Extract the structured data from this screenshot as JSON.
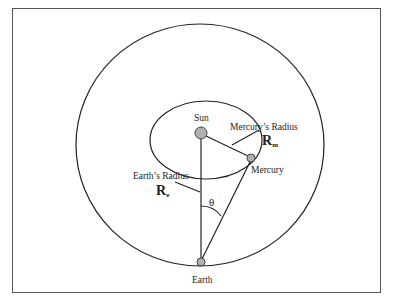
{
  "diagram": {
    "title": "",
    "labels": {
      "sun": "Sun",
      "mercury": "Mercury",
      "earth": "Earth",
      "mercury_radius": "Mercury’s Radius",
      "earth_radius": "Earth’s Radius",
      "rm_main": "R",
      "rm_sub": "m",
      "re_main": "R",
      "re_sub": "e",
      "angle": "θ"
    },
    "bodies": [
      {
        "name": "Sun",
        "cx": 201,
        "cy": 133,
        "r": 6
      },
      {
        "name": "Mercury",
        "cx": 251,
        "cy": 158,
        "r": 4
      },
      {
        "name": "Earth",
        "cx": 201,
        "cy": 262,
        "r": 4
      }
    ],
    "orbits": [
      {
        "name": "Earth orbit",
        "cx": 200,
        "cy": 145,
        "rx": 124,
        "ry": 121
      },
      {
        "name": "Mercury orbit",
        "cx": 206,
        "cy": 140,
        "rx": 56,
        "ry": 39
      }
    ],
    "colors": {
      "line": "#222222",
      "body_fill": "#b0b0b0",
      "frame": "#555555"
    }
  }
}
